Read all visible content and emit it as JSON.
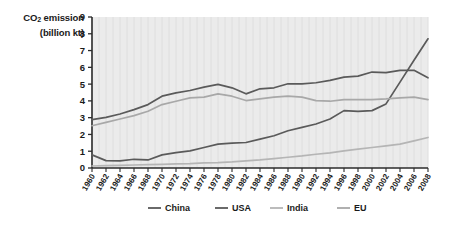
{
  "chart_data": {
    "type": "line",
    "title": "CO2 emission (billion kt)",
    "title_line1": "CO",
    "title_sub": "2",
    "title_line1b": " emission",
    "title_line2": "(billion kt)",
    "xlabel": "",
    "ylabel": "CO2 emission (billion kt)",
    "ylim": [
      0,
      9
    ],
    "xlim": [
      1960,
      2008
    ],
    "yticks": [
      0,
      1,
      2,
      3,
      4,
      5,
      6,
      7,
      8,
      9
    ],
    "ytick_labels": [
      "0",
      "1",
      "2",
      "3",
      "4",
      "5",
      "6",
      "7",
      "8",
      "9"
    ],
    "x": [
      1960,
      1962,
      1964,
      1966,
      1968,
      1970,
      1972,
      1974,
      1976,
      1978,
      1980,
      1982,
      1984,
      1986,
      1988,
      1990,
      1992,
      1994,
      1996,
      1998,
      2000,
      2002,
      2004,
      2006,
      2008
    ],
    "categories": [
      "1960",
      "1962",
      "1964",
      "1966",
      "1968",
      "1970",
      "1972",
      "1974",
      "1976",
      "1978",
      "1980",
      "1982",
      "1984",
      "1986",
      "1988",
      "1990",
      "1992",
      "1994",
      "1996",
      "1998",
      "2000",
      "2002",
      "2004",
      "2006",
      "2008"
    ],
    "grid": "vertical",
    "legend_position": "bottom",
    "plot_background": "#ebebeb",
    "series": [
      {
        "name": "China",
        "color": "#5a5a5a",
        "values": [
          0.78,
          0.44,
          0.42,
          0.52,
          0.48,
          0.78,
          0.92,
          1.02,
          1.22,
          1.42,
          1.48,
          1.52,
          1.72,
          1.92,
          2.22,
          2.42,
          2.62,
          2.92,
          3.42,
          3.38,
          3.42,
          3.82,
          5.12,
          6.42,
          7.7
        ]
      },
      {
        "name": "USA",
        "color": "#5a5a5a",
        "values": [
          2.88,
          3.02,
          3.22,
          3.48,
          3.78,
          4.28,
          4.48,
          4.62,
          4.82,
          4.98,
          4.78,
          4.42,
          4.72,
          4.78,
          5.02,
          5.02,
          5.08,
          5.22,
          5.42,
          5.48,
          5.72,
          5.68,
          5.82,
          5.82,
          5.38
        ]
      },
      {
        "name": "India",
        "color": "#b5b5b5",
        "values": [
          0.12,
          0.14,
          0.16,
          0.18,
          0.2,
          0.22,
          0.24,
          0.26,
          0.3,
          0.32,
          0.36,
          0.42,
          0.48,
          0.56,
          0.64,
          0.72,
          0.82,
          0.9,
          1.02,
          1.12,
          1.22,
          1.32,
          1.42,
          1.62,
          1.82
        ]
      },
      {
        "name": "EU",
        "color": "#a8a8a8",
        "values": [
          2.52,
          2.72,
          2.92,
          3.12,
          3.38,
          3.78,
          3.98,
          4.18,
          4.22,
          4.42,
          4.28,
          4.02,
          4.12,
          4.22,
          4.28,
          4.22,
          4.02,
          3.98,
          4.08,
          4.08,
          4.08,
          4.12,
          4.18,
          4.22,
          4.08
        ]
      }
    ]
  },
  "legend": {
    "items": [
      {
        "label": "China",
        "color": "#5a5a5a"
      },
      {
        "label": "USA",
        "color": "#5a5a5a"
      },
      {
        "label": "India",
        "color": "#b5b5b5"
      },
      {
        "label": "EU",
        "color": "#a8a8a8"
      }
    ]
  }
}
